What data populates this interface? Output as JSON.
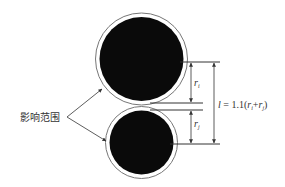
{
  "diagram": {
    "influence_label": "影响范围",
    "top_circle": {
      "name": "particle-i",
      "cx": 141.5,
      "cy": 59,
      "r_outer": 46,
      "r_inner": 42
    },
    "bottom_circle": {
      "name": "particle-j",
      "cx": 141.5,
      "cy": 142.5,
      "r_outer": 36,
      "r_inner": 32
    },
    "dimension": {
      "ri_label": "r",
      "ri_sub": "i",
      "rj_label": "r",
      "rj_sub": "j",
      "formula_l": "l",
      "formula_eq": " = 1.1(",
      "formula_r1": "r",
      "formula_s1": "i",
      "formula_plus": "+",
      "formula_r2": "r",
      "formula_s2": "j",
      "formula_close": ")"
    },
    "colors": {
      "fill": "#0a0a0a",
      "line": "#333333",
      "ring": "#777777"
    }
  }
}
